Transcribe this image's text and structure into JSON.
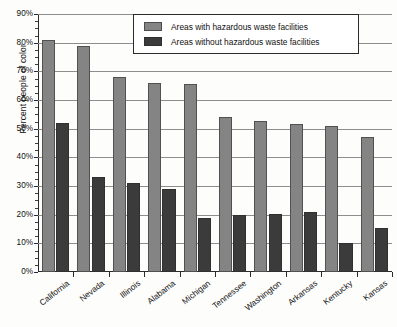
{
  "chart_data": {
    "type": "bar",
    "title": "",
    "xlabel": "",
    "ylabel": "Percent people of color",
    "ylim": [
      0,
      90
    ],
    "ytick_step": 10,
    "yminor_step": 2.5,
    "ytick_labels": [
      "0%",
      "10%",
      "20%",
      "30%",
      "40%",
      "50%",
      "60%",
      "70%",
      "80%",
      "90%"
    ],
    "ytick_values": [
      0,
      10,
      20,
      30,
      40,
      50,
      60,
      70,
      80,
      90
    ],
    "grid": true,
    "legend_position": "top-center",
    "categories": [
      "California",
      "Nevada",
      "Illinois",
      "Alabama",
      "Michigan",
      "Tennessee",
      "Washington",
      "Arkansas",
      "Kentucky",
      "Kansas"
    ],
    "series": [
      {
        "name": "Areas with hazardous waste facilities",
        "color": "#848484",
        "values": [
          81,
          79,
          68,
          66,
          65.5,
          54,
          52.7,
          51.5,
          51,
          47
        ]
      },
      {
        "name": "Areas without hazardous waste facilities",
        "color": "#3b3b3b",
        "values": [
          52,
          33,
          31,
          29,
          19,
          20,
          20.3,
          21,
          10,
          15.5
        ]
      }
    ]
  },
  "legend": {
    "items": [
      {
        "label": "Areas with hazardous waste facilities",
        "swatch": "gray-swatch"
      },
      {
        "label": "Areas without hazardous waste facilities",
        "swatch": "dark-swatch"
      }
    ]
  },
  "source_note": ""
}
